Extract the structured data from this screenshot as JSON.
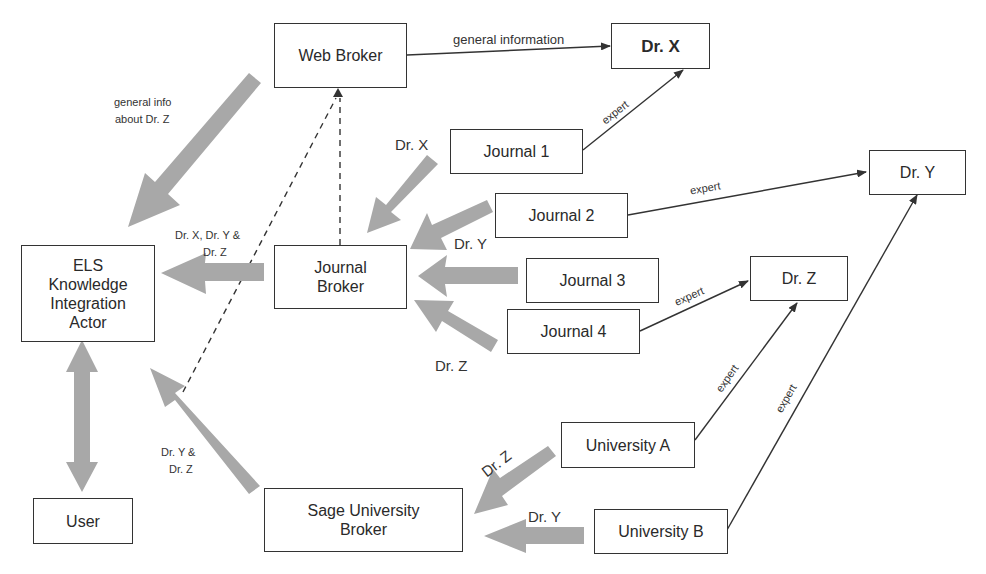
{
  "diagram": {
    "nodes": {
      "web_broker": "Web Broker",
      "dr_x": "Dr. X",
      "dr_y": "Dr. Y",
      "dr_z": "Dr. Z",
      "journal_1": "Journal 1",
      "journal_2": "Journal 2",
      "journal_3": "Journal 3",
      "journal_4": "Journal 4",
      "journal_broker_line1": "Journal",
      "journal_broker_line2": "Broker",
      "els_line1": "ELS",
      "els_line2": "Knowledge",
      "els_line3": "Integration",
      "els_line4": "Actor",
      "user": "User",
      "sage_line1": "Sage University",
      "sage_line2": "Broker",
      "university_a": "University A",
      "university_b": "University B"
    },
    "edge_labels": {
      "general_information": "general information",
      "general_info_line1": "general info",
      "general_info_line2": "about Dr. Z",
      "expert_j1_x": "expert",
      "expert_j2_y": "expert",
      "expert_j4_z": "expert",
      "expert_ua_z": "expert",
      "expert_ub_y": "expert",
      "flow_dr_x": "Dr. X",
      "flow_dr_y_j2": "Dr. Y",
      "flow_dr_z_j4": "Dr. Z",
      "flow_xyz_line1": "Dr. X, Dr. Y &",
      "flow_xyz_line2": "Dr. Z",
      "flow_yz_line1": "Dr. Y &",
      "flow_yz_line2": "Dr. Z",
      "flow_dr_z_ua": "Dr. Z",
      "flow_dr_y_ub": "Dr. Y"
    },
    "colors": {
      "box_border": "#333333",
      "thin_arrow": "#333333",
      "thick_arrow": "#a6a6a6",
      "background": "#ffffff"
    }
  }
}
